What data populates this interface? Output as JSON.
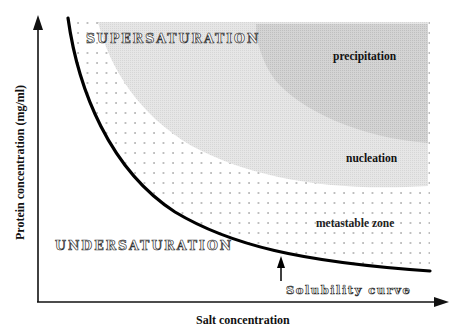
{
  "diagram": {
    "axes": {
      "x_label": "Salt concentration",
      "y_label": "Protein concentration (mg/ml)"
    },
    "regions": {
      "supersaturation": "SUPERSATURATION",
      "undersaturation": "UNDERSATURATION",
      "precipitation": "precipitation",
      "nucleation": "nucleation",
      "metastable": "metastable zone"
    },
    "annotations": {
      "solubility_curve": "Solubility curve"
    },
    "colors": {
      "curve": "#000000",
      "nucleation_fill": "#e4e4e4",
      "precipitation_fill": "#cfcfcf",
      "dots": "#777777",
      "axis": "#111111"
    }
  }
}
